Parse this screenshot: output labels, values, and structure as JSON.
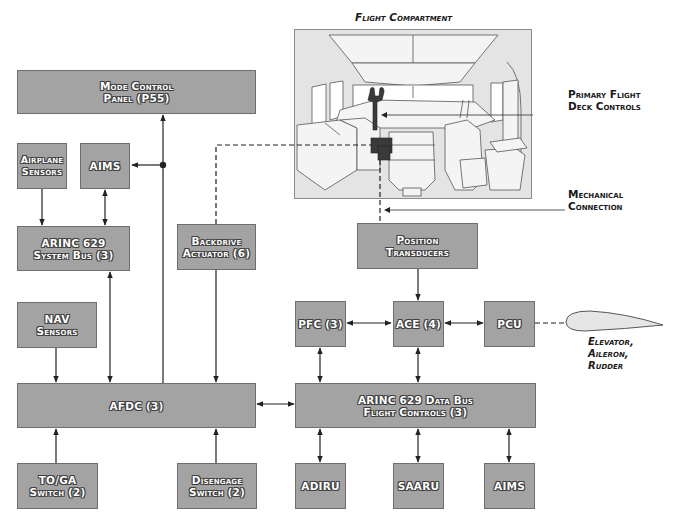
{
  "diagram": {
    "colors": {
      "box_fill": "#a3a3a3",
      "box_border": "#6e6e6e",
      "line": "#222222",
      "cockpit_fill": "#e4e4e4",
      "control_column": "#3a3a3a",
      "airfoil_fill": "#e6e6e6"
    },
    "title": "Flight Compartment",
    "callouts": {
      "primary_controls": [
        "Primary Flight",
        "Deck Controls"
      ],
      "mechanical_connection": [
        "Mechanical",
        "Connection"
      ],
      "surfaces": [
        "Elevator,",
        "Aileron,",
        "Rudder"
      ]
    },
    "boxes": {
      "mcp": [
        "Mode Control",
        "Panel (P55)"
      ],
      "airplane_sensors": [
        "Airplane",
        "Sensors"
      ],
      "aims_top": [
        "AIMS"
      ],
      "arinc_system_bus": [
        "ARINC 629",
        "System Bus (3)"
      ],
      "backdrive_actuator": [
        "Backdrive",
        "Actuator (6)"
      ],
      "nav_sensors": [
        "NAV",
        "Sensors"
      ],
      "afdc": [
        "AFDC (3)"
      ],
      "toga_switch": [
        "TO/GA",
        "Switch (2)"
      ],
      "disengage_switch": [
        "Disengage",
        "Switch (2)"
      ],
      "position_transducers": [
        "Position",
        "Transducers"
      ],
      "pfc": [
        "PFC (3)"
      ],
      "ace": [
        "ACE (4)"
      ],
      "pcu": [
        "PCU"
      ],
      "arinc_data_bus": [
        "ARINC 629 Data Bus",
        "Flight Controls (3)"
      ],
      "adiru": [
        "ADIRU"
      ],
      "saaru": [
        "SAARU"
      ],
      "aims_bottom": [
        "AIMS"
      ]
    },
    "connections": [
      {
        "from": "airplane_sensors",
        "to": "arinc_system_bus",
        "type": "arrow"
      },
      {
        "from": "aims_top",
        "to": "arinc_system_bus",
        "type": "bidirectional"
      },
      {
        "from": "junction",
        "to": "aims_top",
        "type": "arrow"
      },
      {
        "from": "afdc",
        "to": "mcp",
        "type": "arrow"
      },
      {
        "from": "arinc_system_bus",
        "to": "afdc",
        "type": "bidirectional"
      },
      {
        "from": "nav_sensors",
        "to": "afdc",
        "type": "arrow"
      },
      {
        "from": "backdrive_actuator",
        "to": "afdc",
        "type": "bidirectional"
      },
      {
        "from": "backdrive_actuator",
        "to": "primary_flight_deck_controls",
        "type": "mechanical-dashed"
      },
      {
        "from": "toga_switch",
        "to": "afdc",
        "type": "arrow"
      },
      {
        "from": "disengage_switch",
        "to": "afdc",
        "type": "arrow"
      },
      {
        "from": "afdc",
        "to": "arinc_data_bus",
        "type": "bidirectional"
      },
      {
        "from": "primary_flight_deck_controls",
        "to": "position_transducers",
        "type": "mechanical-dashed"
      },
      {
        "from": "position_transducers",
        "to": "ace",
        "type": "arrow"
      },
      {
        "from": "pfc",
        "to": "ace",
        "type": "bidirectional"
      },
      {
        "from": "ace",
        "to": "pcu",
        "type": "bidirectional"
      },
      {
        "from": "pcu",
        "to": "control_surface",
        "type": "mechanical-dashed"
      },
      {
        "from": "pfc",
        "to": "arinc_data_bus",
        "type": "bidirectional"
      },
      {
        "from": "ace",
        "to": "arinc_data_bus",
        "type": "bidirectional"
      },
      {
        "from": "arinc_data_bus",
        "to": "adiru",
        "type": "bidirectional"
      },
      {
        "from": "arinc_data_bus",
        "to": "saaru",
        "type": "bidirectional"
      },
      {
        "from": "arinc_data_bus",
        "to": "aims_bottom",
        "type": "bidirectional"
      }
    ]
  }
}
